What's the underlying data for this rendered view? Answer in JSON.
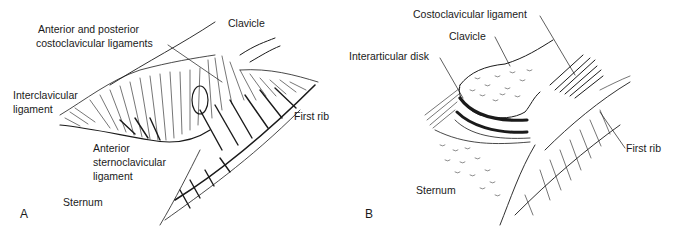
{
  "figure": {
    "panels": [
      {
        "letter": "A",
        "view": "anterior view",
        "labels": {
          "costoclavicular_line1": "Anterior and posterior",
          "costoclavicular_line2": "costoclavicular ligaments",
          "clavicle": "Clavicle",
          "interclavicular_line1": "Interclavicular",
          "interclavicular_line2": "ligament",
          "first_rib": "First rib",
          "anterior_sc_line1": "Anterior",
          "anterior_sc_line2": "sternoclavicular",
          "anterior_sc_line3": "ligament",
          "sternum": "Sternum"
        }
      },
      {
        "letter": "B",
        "view": "coronal section",
        "labels": {
          "costoclavicular": "Costoclavicular ligament",
          "clavicle": "Clavicle",
          "interarticular_disk": "Interarticular disk",
          "first_rib": "First rib",
          "sternum": "Sternum"
        }
      }
    ]
  },
  "colors": {
    "ink": "#1a1a1a",
    "background": "#ffffff"
  }
}
